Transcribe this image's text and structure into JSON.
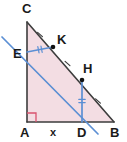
{
  "figure": {
    "background_color": "#ffffff",
    "fill_color": "#f3dde3",
    "side_color": "#3d3d3d",
    "blue_color": "#5b8fd4",
    "right_angle_color": "#d9536f",
    "label_color": "#1a1a1a"
  },
  "points": [
    {
      "name": "C",
      "label": "C",
      "x": 27,
      "y": 22,
      "label_x": 22,
      "label_y": 13,
      "dot": false
    },
    {
      "name": "E",
      "label": "E",
      "x": 27,
      "y": 52,
      "label_x": 13,
      "label_y": 58,
      "dot": false
    },
    {
      "name": "K",
      "label": "K",
      "x": 53,
      "y": 47,
      "label_x": 57,
      "label_y": 44,
      "dot": true
    },
    {
      "name": "H",
      "label": "H",
      "x": 82,
      "y": 80,
      "label_x": 83,
      "label_y": 73,
      "dot": true
    },
    {
      "name": "A",
      "label": "A",
      "x": 27,
      "y": 122,
      "label_x": 20,
      "label_y": 137,
      "dot": false
    },
    {
      "name": "D",
      "label": "D",
      "x": 82,
      "y": 122,
      "label_x": 77,
      "label_y": 137,
      "dot": false
    },
    {
      "name": "B",
      "label": "B",
      "x": 114,
      "y": 122,
      "label_x": 110,
      "label_y": 137,
      "dot": false
    }
  ],
  "segment_labels": [
    {
      "name": "x",
      "label": "x",
      "x": 50,
      "y": 136
    }
  ],
  "triangle": {
    "vertices": "27,22 27,122 114,122",
    "sides": [
      {
        "name": "side-CA",
        "from": "C",
        "to": "A"
      },
      {
        "name": "side-AB",
        "from": "A",
        "to": "B"
      },
      {
        "name": "side-CB",
        "from": "C",
        "to": "B"
      }
    ]
  },
  "blue_lines": [
    {
      "name": "line-ED-extended",
      "x1": 2,
      "y1": 37,
      "x2": 98,
      "y2": 134
    },
    {
      "name": "segment-EK",
      "x1": 27,
      "y1": 52,
      "x2": 53,
      "y2": 47
    },
    {
      "name": "segment-DH",
      "x1": 82,
      "y1": 122,
      "x2": 82,
      "y2": 80
    }
  ],
  "tick_marks": [
    {
      "name": "tick-CK",
      "count": 1,
      "x": 40,
      "y": 34.5,
      "angle": -49
    },
    {
      "name": "tick-KH",
      "count": 1,
      "x": 67.5,
      "y": 63.5,
      "angle": -49
    },
    {
      "name": "tick-HB",
      "count": 1,
      "x": 98,
      "y": 101,
      "angle": -49
    },
    {
      "name": "tick-EK",
      "count": 2,
      "x": 40,
      "y": 49.5,
      "angle": -11
    },
    {
      "name": "tick-DH",
      "count": 2,
      "x": 82,
      "y": 101,
      "angle": 90
    }
  ],
  "right_angle": {
    "name": "right-angle-A",
    "vertex_x": 27,
    "vertex_y": 122,
    "size": 9
  }
}
